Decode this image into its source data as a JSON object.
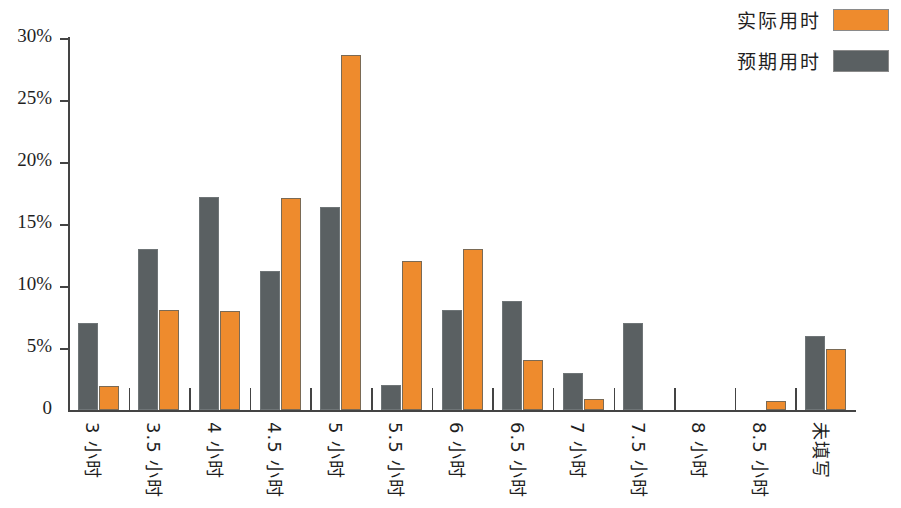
{
  "chart_data": {
    "type": "bar",
    "title": "",
    "subtitle": "",
    "xlabel": "",
    "ylabel": "",
    "grid": false,
    "legend_position": "top-right",
    "categories": [
      "3 小时",
      "3.5 小时",
      "4 小时",
      "4.5 小时",
      "5 小时",
      "5.5 小时",
      "6 小时",
      "6.5 小时",
      "7 小时",
      "7.5 小时",
      "8 小时",
      "8.5 小时",
      "未填写"
    ],
    "series": [
      {
        "name": "实际用时",
        "color": "#EE8B2D",
        "values": [
          1.9,
          8.1,
          8.0,
          17.1,
          28.6,
          12.0,
          13.0,
          4.0,
          0.9,
          0,
          0,
          0.7,
          4.9
        ]
      },
      {
        "name": "预期用时",
        "color": "#5A6062",
        "values": [
          7.0,
          13.0,
          17.2,
          11.2,
          16.4,
          2.0,
          8.1,
          8.8,
          3.0,
          7.0,
          0,
          0,
          6.0
        ]
      }
    ],
    "ylim": [
      0,
      31
    ],
    "ytick_values": [
      0,
      5,
      10,
      15,
      20,
      25,
      30
    ],
    "ytick_labels": [
      "0",
      "5%",
      "10%",
      "15%",
      "20%",
      "25%",
      "30%"
    ]
  }
}
